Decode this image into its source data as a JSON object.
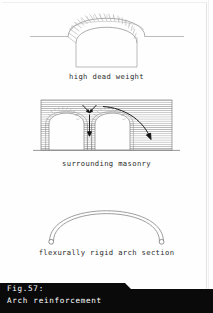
{
  "page": {
    "background_color": "#ffffff",
    "border_color": "#e3e3e3"
  },
  "figures": [
    {
      "id": "high-dead-weight",
      "caption": "high dead weight",
      "description": "Masonry arch of radial voussoirs with horizontal ground line and rectangular opening below",
      "line_color": "#8a8a8a",
      "voussoir_count": 21
    },
    {
      "id": "surrounding-masonry",
      "caption": "surrounding masonry",
      "description": "Two-bay arcade in hatched surrounding masonry with vertical load arrow on central pier and curved thrust arrow to the right abutment",
      "line_color": "#6f6f6f",
      "hatch_color": "#9a9a9a",
      "arrow_color": "#1a1a1a",
      "bays": 2
    },
    {
      "id": "flexurally-rigid-arch-section",
      "caption": "flexurally rigid arch section",
      "description": "Slender two-line arch rib pinned at both springings with small circular hinge symbols",
      "line_color": "#7d7d7d",
      "hinge_count": 2
    }
  ],
  "fig_caption": {
    "number": "Fig.57:",
    "title": "Arch reinforcement",
    "text_color": "#ffffff",
    "background_color": "#0a0a0a"
  }
}
